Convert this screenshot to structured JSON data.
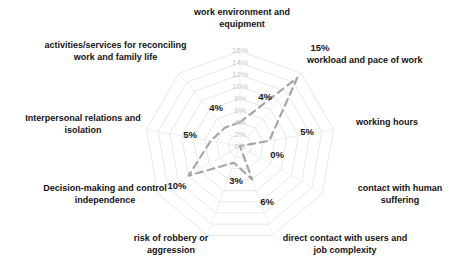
{
  "chart_data": {
    "type": "radar",
    "title": "",
    "subtitle": "",
    "xlabel": "",
    "ylabel": "",
    "grid": true,
    "legend": "none",
    "value_suffix": "%",
    "rlim": [
      0,
      16
    ],
    "r_ticks": [
      "0%",
      "2%",
      "4%",
      "6%",
      "8%",
      "10%",
      "12%",
      "14%",
      "16%"
    ],
    "r_tick_values": [
      0,
      2,
      4,
      6,
      8,
      10,
      12,
      14,
      16
    ],
    "categories": [
      "work environment and equipment",
      "workload and pace of work",
      "working hours",
      "contact with human suffering",
      "direct contact with users and job complexity",
      "risk of robbery or aggression",
      "Decision-making and control independence",
      "Interpersonal relations and isolation",
      "activities/services for reconciling work and family life"
    ],
    "values": [
      4,
      15,
      5,
      0,
      6,
      3,
      10,
      5,
      4
    ],
    "data_labels": [
      "4%",
      "15%",
      "5%",
      "0%",
      "6%",
      "3%",
      "10%",
      "5%",
      "4%"
    ],
    "series": [
      {
        "name": "",
        "values": [
          4,
          15,
          5,
          0,
          6,
          3,
          10,
          5,
          4
        ],
        "line_color": "#a6a6a6",
        "line_style": "dashed",
        "marker": "none"
      }
    ],
    "colors": {
      "grid": "#e4e4e4",
      "spoke": "#ededed",
      "series_line": "#a6a6a6",
      "tick_text": "#c9c9c9",
      "label_text": "#131313",
      "background": "#ffffff"
    }
  },
  "axis_labels": {
    "work_environment": "work environment and equipment",
    "workload": "workload and pace of work",
    "working_hours": "working hours",
    "human_suffering": "contact with human suffering",
    "direct_contact": "direct contact with users and job complexity",
    "robbery": "risk of robbery or aggression",
    "decision_making": "Decision-making and control independence",
    "interpersonal": "Interpersonal relations and isolation",
    "reconciling": "activities/services for reconciling work and family life"
  },
  "value_labels": {
    "work_environment": "4%",
    "workload": "15%",
    "working_hours": "5%",
    "human_suffering": "0%",
    "direct_contact": "6%",
    "robbery": "3%",
    "decision_making": "10%",
    "interpersonal": "5%",
    "reconciling": "4%"
  },
  "radial_ticks": {
    "t0": "0%",
    "t2": "2%",
    "t4": "4%",
    "t6": "6%",
    "t8": "8%",
    "t10": "10%",
    "t12": "12%",
    "t14": "14%",
    "t16": "16%"
  }
}
